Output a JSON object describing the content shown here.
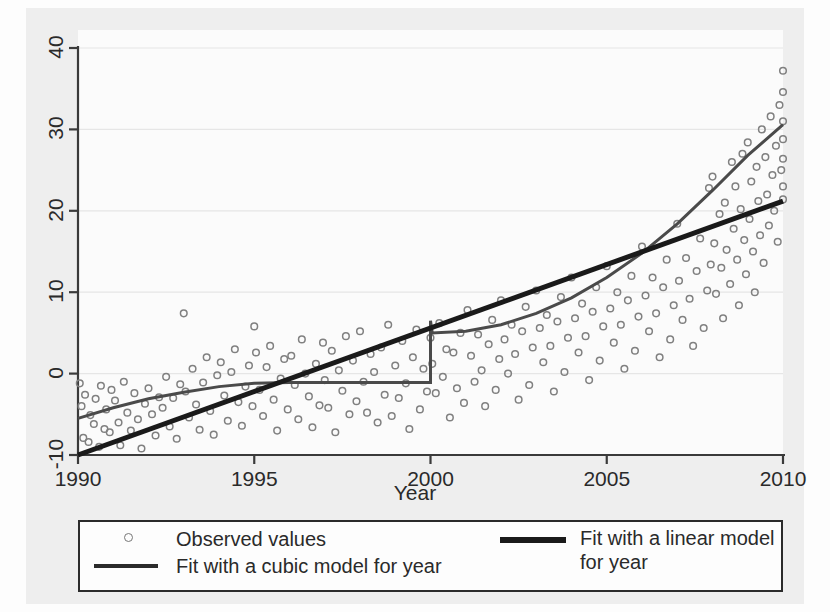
{
  "chart_data": {
    "type": "scatter",
    "title": "",
    "subtitle": "",
    "xlabel": "Year",
    "ylabel": "",
    "xlim": [
      1990,
      2010
    ],
    "ylim": [
      -10,
      40
    ],
    "xticks": [
      1990,
      1995,
      2000,
      2005,
      2010
    ],
    "yticks": [
      -10,
      0,
      10,
      20,
      30,
      40
    ],
    "grid": true,
    "grid_axis": "y",
    "legend_position": "bottom",
    "marker_color": "#808080",
    "line_color": "#1a1a1a",
    "series": [
      {
        "name": "Observed values",
        "type": "scatter",
        "marker": "open-circle",
        "points": [
          [
            1990.05,
            -1.2
          ],
          [
            1990.1,
            -4.0
          ],
          [
            1990.15,
            -7.9
          ],
          [
            1990.2,
            -2.6
          ],
          [
            1990.3,
            -8.4
          ],
          [
            1990.35,
            -5.1
          ],
          [
            1990.45,
            -6.2
          ],
          [
            1990.5,
            -3.1
          ],
          [
            1990.6,
            -9.0
          ],
          [
            1990.65,
            -1.5
          ],
          [
            1990.75,
            -6.8
          ],
          [
            1990.8,
            -4.4
          ],
          [
            1990.9,
            -7.2
          ],
          [
            1990.95,
            -2.0
          ],
          [
            1991.05,
            -3.3
          ],
          [
            1991.15,
            -6.0
          ],
          [
            1991.2,
            -8.8
          ],
          [
            1991.3,
            -1.0
          ],
          [
            1991.4,
            -4.8
          ],
          [
            1991.5,
            -7.0
          ],
          [
            1991.6,
            -2.4
          ],
          [
            1991.7,
            -5.6
          ],
          [
            1991.8,
            -9.2
          ],
          [
            1991.9,
            -3.7
          ],
          [
            1992.0,
            -1.8
          ],
          [
            1992.1,
            -5.0
          ],
          [
            1992.2,
            -7.6
          ],
          [
            1992.3,
            -2.9
          ],
          [
            1992.4,
            -4.2
          ],
          [
            1992.5,
            -0.4
          ],
          [
            1992.6,
            -6.5
          ],
          [
            1992.7,
            -3.0
          ],
          [
            1992.8,
            -8.0
          ],
          [
            1992.9,
            -1.3
          ],
          [
            1993.0,
            7.4
          ],
          [
            1993.05,
            -2.2
          ],
          [
            1993.15,
            -5.4
          ],
          [
            1993.25,
            0.6
          ],
          [
            1993.35,
            -3.8
          ],
          [
            1993.45,
            -6.9
          ],
          [
            1993.55,
            -1.1
          ],
          [
            1993.65,
            2.0
          ],
          [
            1993.75,
            -4.6
          ],
          [
            1993.85,
            -7.5
          ],
          [
            1993.95,
            -0.2
          ],
          [
            1994.05,
            1.4
          ],
          [
            1994.15,
            -2.7
          ],
          [
            1994.25,
            -5.8
          ],
          [
            1994.35,
            0.2
          ],
          [
            1994.45,
            3.0
          ],
          [
            1994.55,
            -3.5
          ],
          [
            1994.65,
            -6.4
          ],
          [
            1994.75,
            -1.6
          ],
          [
            1994.85,
            1.0
          ],
          [
            1994.95,
            -4.0
          ],
          [
            1995.0,
            5.8
          ],
          [
            1995.05,
            2.6
          ],
          [
            1995.15,
            -2.0
          ],
          [
            1995.25,
            -5.2
          ],
          [
            1995.35,
            0.8
          ],
          [
            1995.45,
            3.4
          ],
          [
            1995.55,
            -3.2
          ],
          [
            1995.65,
            -7.0
          ],
          [
            1995.75,
            -0.6
          ],
          [
            1995.85,
            1.8
          ],
          [
            1995.95,
            -4.4
          ],
          [
            1996.05,
            2.2
          ],
          [
            1996.15,
            -1.4
          ],
          [
            1996.25,
            -5.6
          ],
          [
            1996.35,
            4.2
          ],
          [
            1996.45,
            0.0
          ],
          [
            1996.55,
            -2.8
          ],
          [
            1996.65,
            -6.6
          ],
          [
            1996.75,
            1.2
          ],
          [
            1996.85,
            -3.9
          ],
          [
            1996.95,
            3.8
          ],
          [
            1997.0,
            -0.8
          ],
          [
            1997.1,
            -4.2
          ],
          [
            1997.2,
            2.8
          ],
          [
            1997.3,
            -7.2
          ],
          [
            1997.4,
            0.4
          ],
          [
            1997.5,
            -2.1
          ],
          [
            1997.6,
            4.6
          ],
          [
            1997.7,
            -5.0
          ],
          [
            1997.8,
            1.6
          ],
          [
            1997.9,
            -3.4
          ],
          [
            1998.0,
            5.2
          ],
          [
            1998.1,
            -1.0
          ],
          [
            1998.2,
            -4.8
          ],
          [
            1998.3,
            2.4
          ],
          [
            1998.4,
            0.2
          ],
          [
            1998.5,
            -6.0
          ],
          [
            1998.6,
            3.2
          ],
          [
            1998.7,
            -2.6
          ],
          [
            1998.8,
            6.0
          ],
          [
            1998.9,
            -5.2
          ],
          [
            1999.0,
            1.0
          ],
          [
            1999.1,
            -3.0
          ],
          [
            1999.2,
            4.0
          ],
          [
            1999.3,
            -1.2
          ],
          [
            1999.4,
            -6.8
          ],
          [
            1999.5,
            2.0
          ],
          [
            1999.6,
            5.4
          ],
          [
            1999.7,
            -4.4
          ],
          [
            1999.8,
            0.6
          ],
          [
            1999.9,
            -2.2
          ],
          [
            2000.0,
            4.4
          ],
          [
            2000.05,
            1.2
          ],
          [
            2000.15,
            -2.4
          ],
          [
            2000.25,
            6.2
          ],
          [
            2000.35,
            -0.4
          ],
          [
            2000.45,
            3.0
          ],
          [
            2000.55,
            -5.4
          ],
          [
            2000.65,
            2.6
          ],
          [
            2000.75,
            -1.8
          ],
          [
            2000.85,
            5.0
          ],
          [
            2000.95,
            -3.6
          ],
          [
            2001.05,
            7.8
          ],
          [
            2001.15,
            2.2
          ],
          [
            2001.25,
            -1.0
          ],
          [
            2001.35,
            4.8
          ],
          [
            2001.45,
            0.4
          ],
          [
            2001.55,
            -4.0
          ],
          [
            2001.65,
            3.6
          ],
          [
            2001.75,
            6.6
          ],
          [
            2001.85,
            -2.0
          ],
          [
            2001.95,
            1.8
          ],
          [
            2002.0,
            9.0
          ],
          [
            2002.1,
            4.2
          ],
          [
            2002.2,
            0.0
          ],
          [
            2002.3,
            6.0
          ],
          [
            2002.4,
            2.4
          ],
          [
            2002.5,
            -3.2
          ],
          [
            2002.6,
            5.2
          ],
          [
            2002.7,
            8.2
          ],
          [
            2002.8,
            -1.4
          ],
          [
            2002.9,
            3.2
          ],
          [
            2003.0,
            10.2
          ],
          [
            2003.1,
            5.6
          ],
          [
            2003.2,
            1.4
          ],
          [
            2003.3,
            7.2
          ],
          [
            2003.4,
            3.4
          ],
          [
            2003.5,
            -2.2
          ],
          [
            2003.6,
            6.4
          ],
          [
            2003.7,
            9.4
          ],
          [
            2003.8,
            0.2
          ],
          [
            2003.9,
            4.4
          ],
          [
            2004.0,
            11.8
          ],
          [
            2004.1,
            6.8
          ],
          [
            2004.2,
            2.6
          ],
          [
            2004.3,
            8.6
          ],
          [
            2004.4,
            4.6
          ],
          [
            2004.5,
            -0.8
          ],
          [
            2004.6,
            7.6
          ],
          [
            2004.7,
            10.6
          ],
          [
            2004.8,
            1.6
          ],
          [
            2004.9,
            5.8
          ],
          [
            2005.0,
            13.2
          ],
          [
            2005.1,
            8.0
          ],
          [
            2005.2,
            3.8
          ],
          [
            2005.3,
            10.0
          ],
          [
            2005.4,
            6.0
          ],
          [
            2005.5,
            0.6
          ],
          [
            2005.6,
            9.0
          ],
          [
            2005.7,
            12.0
          ],
          [
            2005.8,
            2.8
          ],
          [
            2005.9,
            7.0
          ],
          [
            2006.0,
            15.6
          ],
          [
            2006.1,
            9.6
          ],
          [
            2006.2,
            5.2
          ],
          [
            2006.3,
            11.8
          ],
          [
            2006.4,
            7.4
          ],
          [
            2006.5,
            2.0
          ],
          [
            2006.6,
            10.6
          ],
          [
            2006.7,
            14.0
          ],
          [
            2006.8,
            4.2
          ],
          [
            2006.9,
            8.4
          ],
          [
            2007.0,
            18.4
          ],
          [
            2007.05,
            11.4
          ],
          [
            2007.15,
            6.6
          ],
          [
            2007.25,
            14.2
          ],
          [
            2007.35,
            9.2
          ],
          [
            2007.45,
            3.4
          ],
          [
            2007.55,
            12.6
          ],
          [
            2007.65,
            16.6
          ],
          [
            2007.75,
            5.6
          ],
          [
            2007.85,
            10.2
          ],
          [
            2007.9,
            22.8
          ],
          [
            2007.95,
            13.4
          ],
          [
            2008.0,
            24.2
          ],
          [
            2008.05,
            16.0
          ],
          [
            2008.1,
            9.8
          ],
          [
            2008.2,
            19.6
          ],
          [
            2008.25,
            13.0
          ],
          [
            2008.3,
            6.8
          ],
          [
            2008.35,
            21.0
          ],
          [
            2008.4,
            15.2
          ],
          [
            2008.5,
            11.0
          ],
          [
            2008.55,
            26.0
          ],
          [
            2008.6,
            17.8
          ],
          [
            2008.65,
            23.0
          ],
          [
            2008.7,
            14.0
          ],
          [
            2008.75,
            8.4
          ],
          [
            2008.8,
            20.2
          ],
          [
            2008.85,
            27.0
          ],
          [
            2008.9,
            16.4
          ],
          [
            2008.95,
            12.2
          ],
          [
            2009.0,
            28.4
          ],
          [
            2009.05,
            19.0
          ],
          [
            2009.1,
            23.6
          ],
          [
            2009.15,
            15.0
          ],
          [
            2009.2,
            10.0
          ],
          [
            2009.25,
            25.4
          ],
          [
            2009.3,
            21.2
          ],
          [
            2009.35,
            17.0
          ],
          [
            2009.4,
            30.0
          ],
          [
            2009.45,
            13.6
          ],
          [
            2009.5,
            26.6
          ],
          [
            2009.55,
            22.0
          ],
          [
            2009.6,
            18.2
          ],
          [
            2009.65,
            31.6
          ],
          [
            2009.7,
            24.4
          ],
          [
            2009.75,
            20.0
          ],
          [
            2009.8,
            28.0
          ],
          [
            2009.85,
            16.2
          ],
          [
            2009.9,
            33.0
          ],
          [
            2009.95,
            25.0
          ],
          [
            2010.0,
            37.2
          ],
          [
            2010.0,
            34.6
          ],
          [
            2010.0,
            31.0
          ],
          [
            2010.0,
            28.8
          ],
          [
            2010.0,
            26.4
          ],
          [
            2010.0,
            23.0
          ],
          [
            2010.0,
            21.4
          ]
        ]
      },
      {
        "name": "Fit with a cubic model for year",
        "type": "line",
        "style": "thin",
        "note": "rendered with a vertical discontinuity artifact at year 2000",
        "points": [
          [
            1990.0,
            -5.5
          ],
          [
            1991.0,
            -4.2
          ],
          [
            1992.0,
            -3.1
          ],
          [
            1993.0,
            -2.3
          ],
          [
            1994.0,
            -1.6
          ],
          [
            1995.0,
            -1.2
          ],
          [
            1996.0,
            -1.1
          ],
          [
            1997.0,
            -1.1
          ],
          [
            1998.0,
            -1.1
          ],
          [
            1999.0,
            -1.1
          ],
          [
            2000.0,
            -1.1
          ],
          [
            2000.0,
            6.5
          ],
          [
            2000.05,
            5.0
          ],
          [
            2001.0,
            5.2
          ],
          [
            2002.0,
            6.0
          ],
          [
            2003.0,
            7.4
          ],
          [
            2004.0,
            9.3
          ],
          [
            2005.0,
            11.8
          ],
          [
            2006.0,
            14.8
          ],
          [
            2007.0,
            18.4
          ],
          [
            2008.0,
            22.5
          ],
          [
            2009.0,
            26.8
          ],
          [
            2010.0,
            30.6
          ]
        ]
      },
      {
        "name": "Fit with a linear model for year",
        "type": "line",
        "style": "thick",
        "points": [
          [
            1990.0,
            -10.0
          ],
          [
            2010.0,
            21.2
          ]
        ]
      }
    ]
  },
  "yaxis": {
    "ticks": [
      {
        "label": "40",
        "value": 40
      },
      {
        "label": "30",
        "value": 30
      },
      {
        "label": "20",
        "value": 20
      },
      {
        "label": "10",
        "value": 10
      },
      {
        "label": "0",
        "value": 0
      },
      {
        "label": "-10",
        "value": -10
      }
    ]
  },
  "xaxis": {
    "title": "Year",
    "ticks": [
      {
        "label": "1990",
        "value": 1990
      },
      {
        "label": "1995",
        "value": 1995
      },
      {
        "label": "2000",
        "value": 2000
      },
      {
        "label": "2005",
        "value": 2005
      },
      {
        "label": "2010",
        "value": 2010
      }
    ]
  },
  "legend": {
    "observed_label": "Observed values",
    "cubic_label": "Fit with a cubic model for year",
    "linear_label": "Fit with a linear model for year"
  }
}
